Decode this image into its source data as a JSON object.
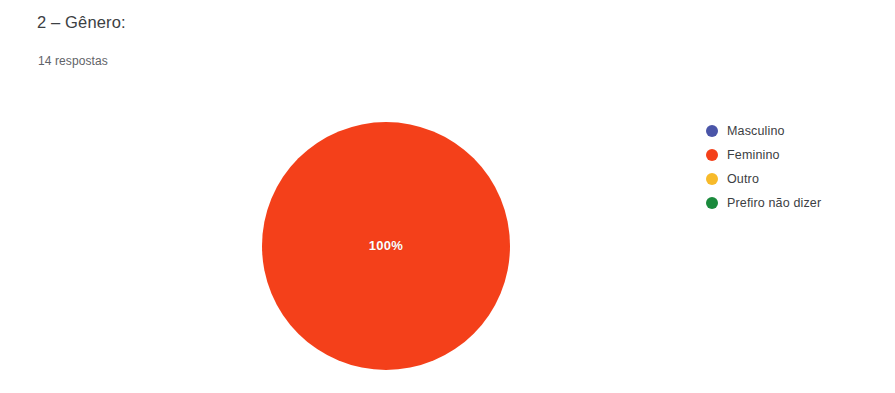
{
  "header": {
    "question_title": "2 – Gênero:",
    "response_count": "14 respostas"
  },
  "chart_data": {
    "type": "pie",
    "title": "2 – Gênero:",
    "subtitle": "14 respostas",
    "total_responses": 14,
    "categories": [
      "Masculino",
      "Feminino",
      "Outro",
      "Prefiro não dizer"
    ],
    "values": [
      0,
      14,
      0,
      0
    ],
    "percentages": [
      0,
      100,
      0,
      0
    ],
    "slice_labels": [
      "",
      "100%",
      "",
      ""
    ],
    "visible_slice_label": "100%",
    "colors": [
      "#4a55a8",
      "#f4401a",
      "#f7ba2a",
      "#1a8a3c"
    ],
    "legend_position": "right",
    "grid": false,
    "slices": [
      {
        "label": "Masculino",
        "value": 0,
        "percent": 0,
        "color": "#4a55a8"
      },
      {
        "label": "Feminino",
        "value": 14,
        "percent": 100,
        "color": "#f4401a"
      },
      {
        "label": "Outro",
        "value": 0,
        "percent": 0,
        "color": "#f7ba2a"
      },
      {
        "label": "Prefiro não dizer",
        "value": 0,
        "percent": 0,
        "color": "#1a8a3c"
      }
    ]
  },
  "legend": {
    "items": [
      {
        "label": "Masculino",
        "color": "#4a55a8"
      },
      {
        "label": "Feminino",
        "color": "#f4401a"
      },
      {
        "label": "Outro",
        "color": "#f7ba2a"
      },
      {
        "label": "Prefiro não dizer",
        "color": "#1a8a3c"
      }
    ]
  }
}
